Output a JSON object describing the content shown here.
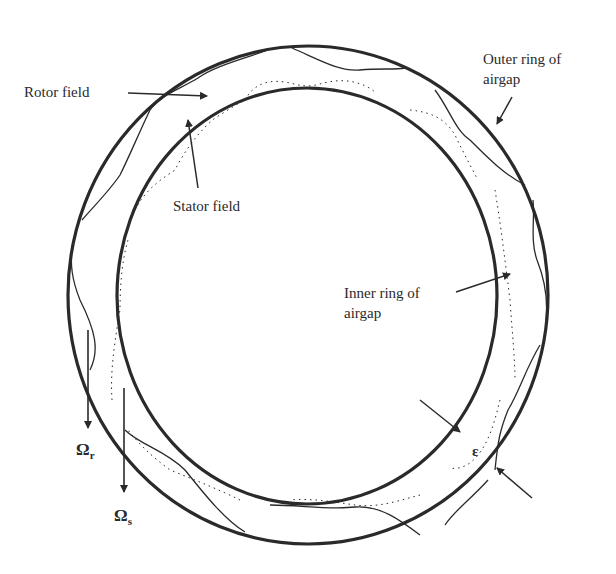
{
  "diagram": {
    "title": "",
    "colors": {
      "stroke": "#2a2a2a",
      "background": "#ffffff"
    },
    "labels": {
      "rotor_field": "Rotor field",
      "stator_field": "Stator field",
      "outer_ring_line1": "Outer ring of",
      "outer_ring_line2": "airgap",
      "inner_ring_line1": "Inner ring of",
      "inner_ring_line2": "airgap",
      "epsilon": "ε",
      "omega_r_base": "Ω",
      "omega_r_sub": "r",
      "omega_s_base": "Ω",
      "omega_s_sub": "s"
    },
    "nodes": [
      {
        "id": "outer-ring",
        "shape": "circle",
        "label": "Outer ring of airgap"
      },
      {
        "id": "inner-ring",
        "shape": "circle",
        "label": "Inner ring of airgap"
      },
      {
        "id": "rotor-field",
        "shape": "wavy-solid-curve",
        "label": "Rotor field"
      },
      {
        "id": "stator-field",
        "shape": "wavy-dotted-curve",
        "label": "Stator field"
      },
      {
        "id": "gap",
        "shape": "marker",
        "label": "ε"
      },
      {
        "id": "omega-r",
        "shape": "arrow-down",
        "label": "Ωr"
      },
      {
        "id": "omega-s",
        "shape": "arrow-down",
        "label": "Ωs"
      }
    ]
  }
}
